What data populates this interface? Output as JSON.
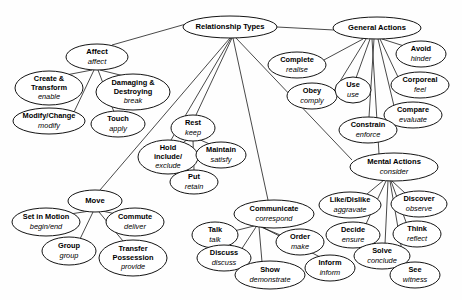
{
  "diagram": {
    "title": "Relationship Types",
    "type": "node-link-ontology",
    "background_color": "#fefefe",
    "node_fill": "#ffffff",
    "node_stroke": "#141414",
    "edge_stroke": "#1a1a1a",
    "nodes": [
      {
        "id": "relationship-types",
        "term": "Relationship Types",
        "gloss": "",
        "cx": 230,
        "cy": 27,
        "rx": 47,
        "ry": 11,
        "fs": 7.6
      },
      {
        "id": "general-actions",
        "term": "General Actions",
        "gloss": "",
        "cx": 377,
        "cy": 28,
        "rx": 44,
        "ry": 11,
        "fs": 7.6
      },
      {
        "id": "affect",
        "term": "Affect",
        "gloss": "affect",
        "cx": 97,
        "cy": 57,
        "rx": 31,
        "ry": 13,
        "fs": 7.6
      },
      {
        "id": "create-transform",
        "term": "Create &",
        "term2": "Transform",
        "gloss": "enable",
        "cx": 49,
        "cy": 88,
        "rx": 34,
        "ry": 17,
        "fs": 7.4
      },
      {
        "id": "damaging-destroying",
        "term": "Damaging &",
        "term2": "Destroying",
        "gloss": "break",
        "cx": 133,
        "cy": 92,
        "rx": 37,
        "ry": 18,
        "fs": 7.4
      },
      {
        "id": "modify-change",
        "term": "Modify/Change",
        "gloss": "modify",
        "cx": 49,
        "cy": 121,
        "rx": 36,
        "ry": 13,
        "fs": 7.4
      },
      {
        "id": "touch",
        "term": "Touch",
        "gloss": "apply",
        "cx": 118,
        "cy": 124,
        "rx": 27,
        "ry": 13,
        "fs": 7.4
      },
      {
        "id": "complete",
        "term": "Complete",
        "gloss": "realise",
        "cx": 297,
        "cy": 65,
        "rx": 29,
        "ry": 13,
        "fs": 7.4
      },
      {
        "id": "obey",
        "term": "Obey",
        "gloss": "comply",
        "cx": 312,
        "cy": 96,
        "rx": 25,
        "ry": 13,
        "fs": 7.4
      },
      {
        "id": "use",
        "term": "Use",
        "gloss": "use",
        "cx": 353,
        "cy": 90,
        "rx": 18,
        "ry": 13,
        "fs": 7.4
      },
      {
        "id": "avoid",
        "term": "Avoid",
        "gloss": "hinder",
        "cx": 421,
        "cy": 54,
        "rx": 25,
        "ry": 13,
        "fs": 7.4
      },
      {
        "id": "corporeal",
        "term": "Corporeal",
        "gloss": "feel",
        "cx": 420,
        "cy": 85,
        "rx": 29,
        "ry": 13,
        "fs": 7.4
      },
      {
        "id": "compare",
        "term": "Compare",
        "gloss": "evaluate",
        "cx": 413,
        "cy": 115,
        "rx": 29,
        "ry": 13,
        "fs": 7.4
      },
      {
        "id": "constrain",
        "term": "Constrain",
        "gloss": "enforce",
        "cx": 368,
        "cy": 130,
        "rx": 29,
        "ry": 13,
        "fs": 7.4
      },
      {
        "id": "rest",
        "term": "Rest",
        "gloss": "keep",
        "cx": 193,
        "cy": 128,
        "rx": 22,
        "ry": 13,
        "fs": 7.4
      },
      {
        "id": "hold",
        "term": "Hold",
        "term2": "include/",
        "gloss": "exclude",
        "cx": 168,
        "cy": 157,
        "rx": 30,
        "ry": 17,
        "fs": 7.4
      },
      {
        "id": "maintain",
        "term": "Maintain",
        "gloss": "satisfy",
        "cx": 221,
        "cy": 155,
        "rx": 25,
        "ry": 13,
        "fs": 7.4
      },
      {
        "id": "put",
        "term": "Put",
        "gloss": "retain",
        "cx": 194,
        "cy": 182,
        "rx": 24,
        "ry": 12,
        "fs": 7.4
      },
      {
        "id": "mental-actions",
        "term": "Mental Actions",
        "gloss": "consider",
        "cx": 394,
        "cy": 167,
        "rx": 44,
        "ry": 14,
        "fs": 7.6
      },
      {
        "id": "move",
        "term": "Move",
        "gloss": "",
        "cx": 95,
        "cy": 201,
        "rx": 27,
        "ry": 11,
        "fs": 7.6
      },
      {
        "id": "set-in-motion",
        "term": "Set in Motion",
        "gloss": "begin/end",
        "cx": 46,
        "cy": 222,
        "rx": 34,
        "ry": 14,
        "fs": 7.4
      },
      {
        "id": "commute",
        "term": "Commute",
        "gloss": "deliver",
        "cx": 135,
        "cy": 222,
        "rx": 29,
        "ry": 14,
        "fs": 7.4
      },
      {
        "id": "group",
        "term": "Group",
        "gloss": "group",
        "cx": 69,
        "cy": 251,
        "rx": 27,
        "ry": 14,
        "fs": 7.4
      },
      {
        "id": "transfer-possession",
        "term": "Transfer",
        "term2": "Possession",
        "gloss": "provide",
        "cx": 133,
        "cy": 258,
        "rx": 34,
        "ry": 18,
        "fs": 7.4
      },
      {
        "id": "communicate",
        "term": "Communicate",
        "gloss": "correspond",
        "cx": 274,
        "cy": 214,
        "rx": 40,
        "ry": 14,
        "fs": 7.4
      },
      {
        "id": "talk",
        "term": "Talk",
        "gloss": "talk",
        "cx": 215,
        "cy": 235,
        "rx": 23,
        "ry": 13,
        "fs": 7.4
      },
      {
        "id": "order",
        "term": "Order",
        "gloss": "make",
        "cx": 300,
        "cy": 242,
        "rx": 24,
        "ry": 13,
        "fs": 7.4
      },
      {
        "id": "discuss",
        "term": "Discuss",
        "gloss": "discuss",
        "cx": 224,
        "cy": 258,
        "rx": 27,
        "ry": 13,
        "fs": 7.4
      },
      {
        "id": "show",
        "term": "Show",
        "gloss": "demonstrate",
        "cx": 270,
        "cy": 275,
        "rx": 35,
        "ry": 14,
        "fs": 7.4
      },
      {
        "id": "inform",
        "term": "Inform",
        "gloss": "inform",
        "cx": 330,
        "cy": 268,
        "rx": 25,
        "ry": 13,
        "fs": 7.4
      },
      {
        "id": "like-dislike",
        "term": "Like/Dislike",
        "gloss": "aggravate",
        "cx": 350,
        "cy": 205,
        "rx": 31,
        "ry": 13,
        "fs": 7.4
      },
      {
        "id": "discover",
        "term": "Discover",
        "gloss": "observe",
        "cx": 419,
        "cy": 204,
        "rx": 28,
        "ry": 13,
        "fs": 7.4
      },
      {
        "id": "decide",
        "term": "Decide",
        "gloss": "ensure",
        "cx": 353,
        "cy": 235,
        "rx": 27,
        "ry": 13,
        "fs": 7.4
      },
      {
        "id": "think",
        "term": "Think",
        "gloss": "reflect",
        "cx": 417,
        "cy": 234,
        "rx": 24,
        "ry": 13,
        "fs": 7.4
      },
      {
        "id": "solve",
        "term": "Solve",
        "gloss": "conclude",
        "cx": 382,
        "cy": 256,
        "rx": 28,
        "ry": 13,
        "fs": 7.4
      },
      {
        "id": "see",
        "term": "See",
        "gloss": "witness",
        "cx": 415,
        "cy": 275,
        "rx": 25,
        "ry": 13,
        "fs": 7.4
      }
    ],
    "edges": [
      {
        "from": "relationship-types",
        "to": "affect",
        "x1": 186,
        "y1": 24,
        "x2": 112,
        "y2": 45
      },
      {
        "from": "relationship-types",
        "to": "general-actions",
        "x1": 277,
        "y1": 27,
        "x2": 334,
        "y2": 30
      },
      {
        "from": "relationship-types",
        "to": "hold",
        "x1": 231,
        "y1": 38,
        "x2": 171,
        "y2": 140
      },
      {
        "from": "relationship-types",
        "to": "rest",
        "x1": 232,
        "y1": 38,
        "x2": 196,
        "y2": 115
      },
      {
        "from": "relationship-types",
        "to": "move",
        "x1": 230,
        "y1": 38,
        "x2": 100,
        "y2": 190
      },
      {
        "from": "relationship-types",
        "to": "communicate",
        "x1": 233,
        "y1": 38,
        "x2": 268,
        "y2": 200
      },
      {
        "from": "relationship-types",
        "to": "mental-actions",
        "x1": 236,
        "y1": 38,
        "x2": 352,
        "y2": 160
      },
      {
        "from": "affect",
        "to": "create-transform",
        "x1": 92,
        "y1": 70,
        "x2": 66,
        "y2": 75
      },
      {
        "from": "affect",
        "to": "damaging-destroying",
        "x1": 100,
        "y1": 70,
        "x2": 124,
        "y2": 76
      },
      {
        "from": "affect",
        "to": "modify-change",
        "x1": 94,
        "y1": 70,
        "x2": 74,
        "y2": 112
      },
      {
        "from": "affect",
        "to": "touch",
        "x1": 98,
        "y1": 70,
        "x2": 114,
        "y2": 112
      },
      {
        "from": "general-actions",
        "to": "complete",
        "x1": 363,
        "y1": 39,
        "x2": 322,
        "y2": 61
      },
      {
        "from": "general-actions",
        "to": "obey",
        "x1": 366,
        "y1": 39,
        "x2": 334,
        "y2": 91
      },
      {
        "from": "general-actions",
        "to": "use",
        "x1": 370,
        "y1": 39,
        "x2": 356,
        "y2": 78
      },
      {
        "from": "general-actions",
        "to": "avoid",
        "x1": 382,
        "y1": 39,
        "x2": 404,
        "y2": 46
      },
      {
        "from": "general-actions",
        "to": "corporeal",
        "x1": 380,
        "y1": 39,
        "x2": 398,
        "y2": 77
      },
      {
        "from": "general-actions",
        "to": "compare",
        "x1": 378,
        "y1": 39,
        "x2": 394,
        "y2": 106
      },
      {
        "from": "general-actions",
        "to": "constrain",
        "x1": 374,
        "y1": 39,
        "x2": 369,
        "y2": 117
      },
      {
        "from": "general-actions",
        "to": "mental-actions",
        "x1": 372,
        "y1": 39,
        "x2": 379,
        "y2": 154
      },
      {
        "from": "rest",
        "to": "hold",
        "x1": 188,
        "y1": 139,
        "x2": 180,
        "y2": 145
      },
      {
        "from": "rest",
        "to": "maintain",
        "x1": 198,
        "y1": 139,
        "x2": 212,
        "y2": 145
      },
      {
        "from": "rest",
        "to": "put",
        "x1": 193,
        "y1": 140,
        "x2": 194,
        "y2": 170
      },
      {
        "from": "move",
        "to": "set-in-motion",
        "x1": 90,
        "y1": 211,
        "x2": 70,
        "y2": 214
      },
      {
        "from": "move",
        "to": "commute",
        "x1": 102,
        "y1": 211,
        "x2": 121,
        "y2": 215
      },
      {
        "from": "move",
        "to": "group",
        "x1": 93,
        "y1": 212,
        "x2": 80,
        "y2": 239
      },
      {
        "from": "move",
        "to": "transfer-possession",
        "x1": 99,
        "y1": 212,
        "x2": 123,
        "y2": 241
      },
      {
        "from": "communicate",
        "to": "talk",
        "x1": 254,
        "y1": 226,
        "x2": 234,
        "y2": 231
      },
      {
        "from": "communicate",
        "to": "order",
        "x1": 261,
        "y1": 227,
        "x2": 285,
        "y2": 237
      },
      {
        "from": "communicate",
        "to": "discuss",
        "x1": 256,
        "y1": 227,
        "x2": 241,
        "y2": 250
      },
      {
        "from": "communicate",
        "to": "show",
        "x1": 259,
        "y1": 227,
        "x2": 262,
        "y2": 262
      },
      {
        "from": "communicate",
        "to": "inform",
        "x1": 262,
        "y1": 227,
        "x2": 320,
        "y2": 257
      },
      {
        "from": "mental-actions",
        "to": "like-dislike",
        "x1": 384,
        "y1": 180,
        "x2": 367,
        "y2": 194
      },
      {
        "from": "mental-actions",
        "to": "discover",
        "x1": 392,
        "y1": 181,
        "x2": 405,
        "y2": 193
      },
      {
        "from": "mental-actions",
        "to": "decide",
        "x1": 386,
        "y1": 181,
        "x2": 366,
        "y2": 224
      },
      {
        "from": "mental-actions",
        "to": "think",
        "x1": 391,
        "y1": 181,
        "x2": 406,
        "y2": 222
      },
      {
        "from": "mental-actions",
        "to": "solve",
        "x1": 388,
        "y1": 181,
        "x2": 385,
        "y2": 244
      },
      {
        "from": "mental-actions",
        "to": "see",
        "x1": 390,
        "y1": 181,
        "x2": 404,
        "y2": 263
      }
    ]
  }
}
